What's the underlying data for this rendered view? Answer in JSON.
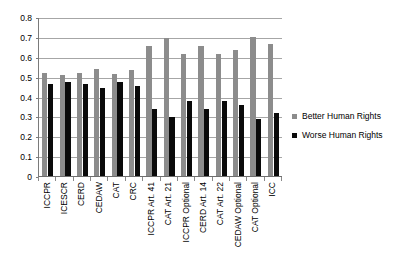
{
  "chart_data": {
    "type": "bar",
    "title": "",
    "subtitle": "",
    "xlabel": "",
    "ylabel": "",
    "ylim": [
      0,
      0.8
    ],
    "ytick_labels": [
      "0.8",
      "0.7",
      "0.6",
      "0.5",
      "0.4",
      "0.3",
      "0.2",
      "0.1",
      "0"
    ],
    "ytick_values": [
      0.8,
      0.7,
      0.6,
      0.5,
      0.4,
      0.3,
      0.2,
      0.1,
      0
    ],
    "grid": true,
    "legend_position": "right",
    "categories": [
      "ICCPR",
      "ICESCR",
      "CERD",
      "CEDAW",
      "CAT",
      "CRC",
      "ICCPR Art. 41",
      "CAT Art. 21",
      "ICCPR Optional",
      "CERD Art. 14",
      "CAT Art. 22",
      "CEDAW Optional",
      "CAT Optional",
      "ICC"
    ],
    "series": [
      {
        "name": "Better Human Rights",
        "color": "#8c8c8c",
        "values": [
          0.525,
          0.515,
          0.525,
          0.545,
          0.52,
          0.54,
          0.66,
          0.7,
          0.62,
          0.66,
          0.62,
          0.64,
          0.705,
          0.67
        ]
      },
      {
        "name": "Worse Human Rights",
        "color": "#0a0a0a",
        "values": [
          0.47,
          0.48,
          0.47,
          0.45,
          0.48,
          0.46,
          0.34,
          0.3,
          0.38,
          0.34,
          0.38,
          0.36,
          0.29,
          0.32
        ]
      }
    ]
  },
  "legend": {
    "entries": [
      {
        "label": "Better Human Rights",
        "color": "#8c8c8c"
      },
      {
        "label": "Worse Human Rights",
        "color": "#0a0a0a"
      }
    ]
  }
}
